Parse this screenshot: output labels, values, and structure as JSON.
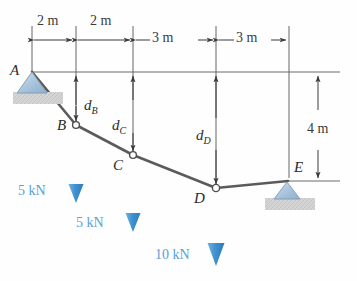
{
  "figure": {
    "type": "cable-with-concentrated-loads-free-body-diagram",
    "colors": {
      "load_blue": "#3e92d0",
      "load_text_blue": "#57a0d8",
      "cable_gray": "#5a5a5a",
      "dimension_gray": "#3a3a3a",
      "support_fill": "#aac4dc",
      "ground_fill": "#d2d2d2"
    }
  },
  "span_dimensions": {
    "label": "horizontal-span-dimensions",
    "segments": [
      {
        "id": "A-B",
        "text": "2 m",
        "value": 2,
        "unit": "m"
      },
      {
        "id": "B-C",
        "text": "2 m",
        "value": 2,
        "unit": "m"
      },
      {
        "id": "C-D",
        "text": "3 m",
        "value": 3,
        "unit": "m"
      },
      {
        "id": "D-E",
        "text": "3 m",
        "value": 3,
        "unit": "m"
      }
    ]
  },
  "vertical_dimension": {
    "text": "4 m",
    "value": 4,
    "unit": "m",
    "description": "vertical-drop-A-datum-to-E"
  },
  "nodes": [
    {
      "id": "A",
      "label": "A",
      "support": "pin",
      "x": 32,
      "y": 72
    },
    {
      "id": "B",
      "label": "B",
      "support": "none",
      "x": 76,
      "y": 125
    },
    {
      "id": "C",
      "label": "C",
      "support": "none",
      "x": 133,
      "y": 155
    },
    {
      "id": "D",
      "label": "D",
      "support": "none",
      "x": 216,
      "y": 188
    },
    {
      "id": "E",
      "label": "E",
      "support": "rocker",
      "x": 287,
      "y": 181
    }
  ],
  "sag_dimensions": [
    {
      "id": "dB",
      "base": "d",
      "sub": "B",
      "at_node": "B"
    },
    {
      "id": "dC",
      "base": "d",
      "sub": "C",
      "at_node": "C"
    },
    {
      "id": "dD",
      "base": "d",
      "sub": "D",
      "at_node": "D"
    }
  ],
  "loads": [
    {
      "id": "load-B",
      "text": "5 kN",
      "value": 5,
      "unit": "kN",
      "at_node": "B",
      "direction": "down"
    },
    {
      "id": "load-C",
      "text": "5 kN",
      "value": 5,
      "unit": "kN",
      "at_node": "C",
      "direction": "down"
    },
    {
      "id": "load-D",
      "text": "10 kN",
      "value": 10,
      "unit": "kN",
      "at_node": "D",
      "direction": "down"
    }
  ]
}
